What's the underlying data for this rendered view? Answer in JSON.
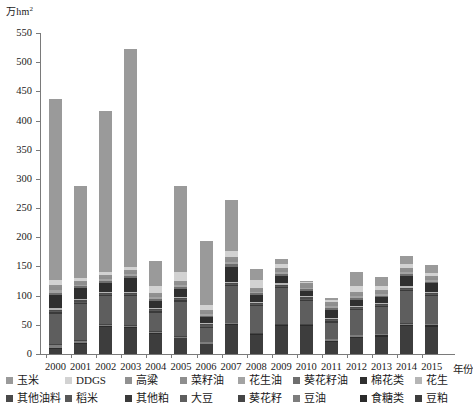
{
  "chart_data": {
    "type": "bar",
    "stacked": true,
    "title": "",
    "subtitle": "",
    "ylabel": "万hm²",
    "xlabel": "年份",
    "ylim": [
      0,
      550
    ],
    "ytick_step": 50,
    "yticks": [
      0,
      50,
      100,
      150,
      200,
      250,
      300,
      350,
      400,
      450,
      500,
      550
    ],
    "grid": false,
    "legend_position": "bottom",
    "categories": [
      "2000",
      "2001",
      "2002",
      "2003",
      "2004",
      "2005",
      "2006",
      "2007",
      "2008",
      "2009",
      "2010",
      "2011",
      "2012",
      "2013",
      "2014",
      "2015"
    ],
    "series": [
      {
        "name": "豆粕",
        "color": "#3d3d3d",
        "values": [
          8,
          17,
          47,
          44,
          35,
          27,
          17,
          50,
          33,
          48,
          48,
          21,
          28,
          30,
          48,
          47
        ]
      },
      {
        "name": "食糖类",
        "color": "#2b2b2b",
        "values": [
          3,
          2,
          1,
          2,
          1,
          1,
          1,
          1,
          1,
          1,
          1,
          2,
          2,
          2,
          2,
          2
        ]
      },
      {
        "name": "豆油",
        "color": "#7d7d7d",
        "values": [
          4,
          3,
          2,
          2,
          2,
          2,
          2,
          2,
          1,
          1,
          1,
          2,
          2,
          2,
          2,
          2
        ]
      },
      {
        "name": "葵花籽",
        "color": "#454545",
        "values": [
          2,
          2,
          1,
          1,
          1,
          1,
          1,
          1,
          1,
          1,
          1,
          1,
          1,
          1,
          1,
          1
        ]
      },
      {
        "name": "大豆",
        "color": "#5e5e5e",
        "values": [
          52,
          62,
          48,
          50,
          32,
          59,
          24,
          62,
          46,
          62,
          40,
          28,
          42,
          45,
          55,
          47
        ]
      },
      {
        "name": "其他粕",
        "color": "#3a3a3a",
        "values": [
          3,
          2,
          2,
          2,
          2,
          2,
          2,
          2,
          2,
          2,
          2,
          2,
          2,
          2,
          2,
          2
        ]
      },
      {
        "name": "稻米",
        "color": "#585858",
        "values": [
          2,
          2,
          2,
          2,
          2,
          2,
          2,
          2,
          2,
          2,
          2,
          2,
          2,
          2,
          2,
          2
        ]
      },
      {
        "name": "其他油料",
        "color": "#4a4a4a",
        "values": [
          2,
          2,
          2,
          2,
          2,
          2,
          2,
          2,
          2,
          2,
          2,
          2,
          2,
          2,
          2,
          2
        ]
      },
      {
        "name": "花生",
        "color": "#b5b5b5",
        "values": [
          3,
          3,
          2,
          2,
          2,
          2,
          2,
          2,
          2,
          2,
          2,
          2,
          2,
          2,
          2,
          2
        ]
      },
      {
        "name": "棉花类",
        "color": "#2f2f2f",
        "values": [
          22,
          18,
          15,
          24,
          12,
          14,
          10,
          26,
          11,
          13,
          9,
          14,
          10,
          9,
          18,
          14
        ]
      },
      {
        "name": "葵花籽油",
        "color": "#6e6e6e",
        "values": [
          4,
          3,
          3,
          3,
          3,
          3,
          3,
          4,
          3,
          3,
          3,
          3,
          3,
          3,
          3,
          3
        ]
      },
      {
        "name": "花生油",
        "color": "#a3a3a3",
        "values": [
          4,
          3,
          3,
          3,
          3,
          3,
          3,
          4,
          3,
          3,
          3,
          3,
          3,
          3,
          3,
          3
        ]
      },
      {
        "name": "菜籽油",
        "color": "#8e8e8e",
        "values": [
          6,
          4,
          4,
          4,
          4,
          4,
          4,
          5,
          4,
          4,
          4,
          4,
          4,
          4,
          4,
          4
        ]
      },
      {
        "name": "高粱",
        "color": "#909090",
        "values": [
          4,
          3,
          3,
          3,
          3,
          3,
          3,
          4,
          3,
          3,
          3,
          3,
          3,
          3,
          3,
          3
        ]
      },
      {
        "name": "DDGS",
        "color": "#d2d2d2",
        "values": [
          8,
          5,
          5,
          5,
          12,
          15,
          8,
          10,
          13,
          8,
          3,
          3,
          10,
          7,
          8,
          5
        ]
      },
      {
        "name": "玉米",
        "color": "#9a9a9a",
        "values": [
          310,
          157,
          277,
          373,
          43,
          148,
          109,
          87,
          18,
          8,
          1,
          5,
          24,
          15,
          13,
          13
        ]
      }
    ],
    "totals": [
      437,
      285,
      417,
      522,
      159,
      288,
      193,
      264,
      147,
      165,
      124,
      97,
      140,
      132,
      170,
      151
    ]
  },
  "legend": {
    "rows": [
      [
        "玉米",
        "DDGS",
        "高粱",
        "菜籽油",
        "花生油",
        "葵花籽油",
        "棉花类",
        "花生"
      ],
      [
        "其他油料",
        "稻米",
        "其他粕",
        "大豆",
        "葵花籽",
        "豆油",
        "食糖类",
        "豆粕"
      ]
    ]
  }
}
